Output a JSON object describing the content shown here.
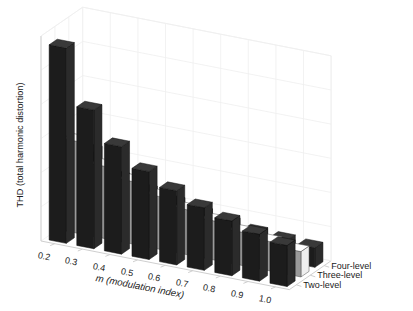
{
  "figure": {
    "background": "#ffffff",
    "axis_color": "#cfcfcf",
    "grid_color": "#efefef",
    "text_color": "#1a1a1a"
  },
  "axes": {
    "zlabel": "THD (total harmonic distortion)",
    "xlabel": "m (modulation index)",
    "xlabel_italic_part": "m",
    "xlabel_rest": " (modulation index)",
    "ylabels": [
      "Two-level",
      "Three-level",
      "Four-level"
    ]
  },
  "chart_data": {
    "type": "bar",
    "subtype": "bar3-grouped-3d",
    "title": "",
    "xlabel": "m (modulation index)",
    "ylabel": "",
    "zlabel": "THD (total harmonic distortion)",
    "categories": [
      "0.2",
      "0.3",
      "0.4",
      "0.5",
      "0.6",
      "0.7",
      "0.8",
      "0.9",
      "1.0"
    ],
    "series": [
      {
        "name": "Two-level",
        "color": "#1c1c1c",
        "values": [
          1.0,
          0.71,
          0.55,
          0.45,
          0.38,
          0.32,
          0.28,
          0.24,
          0.21
        ]
      },
      {
        "name": "Three-level",
        "color": "#9a9a9a",
        "values": [
          0.47,
          0.37,
          0.32,
          0.27,
          0.23,
          0.2,
          0.17,
          0.15,
          0.13
        ]
      },
      {
        "name": "Four-level",
        "color": "#1c1c1c",
        "values": [
          0.37,
          0.26,
          0.22,
          0.19,
          0.16,
          0.14,
          0.12,
          0.11,
          0.1
        ]
      }
    ],
    "zlim": [
      0,
      1.05
    ],
    "grid": true,
    "ticks_on_z": false,
    "legend": "none (y-axis category labels used)"
  }
}
